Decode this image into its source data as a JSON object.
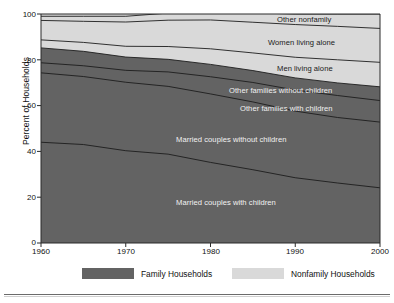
{
  "chart_data": {
    "type": "area",
    "title": "",
    "subtitle": "",
    "xlabel": "",
    "ylabel": "Percent of Households",
    "xlim": [
      1960,
      2000
    ],
    "ylim": [
      0,
      100
    ],
    "grid": false,
    "stacked": true,
    "x": [
      1960,
      1965,
      1970,
      1975,
      1980,
      1985,
      1990,
      1995,
      2000
    ],
    "xticks": [
      "1960",
      "1970",
      "1980",
      "1990",
      "2000"
    ],
    "yticks": [
      "0",
      "20",
      "40",
      "60",
      "80",
      "100"
    ],
    "legend_position": "bottom",
    "series": [
      {
        "name": "Married couples with children",
        "group": "Family Households",
        "color": "#636363",
        "values": [
          44.0,
          43.0,
          40.3,
          38.8,
          35.2,
          32.0,
          28.5,
          26.2,
          24.1
        ]
      },
      {
        "name": "Married couples without children",
        "group": "Family Households",
        "color": "#636363",
        "values": [
          30.3,
          29.7,
          29.9,
          29.6,
          29.9,
          29.6,
          29.1,
          28.6,
          28.7
        ]
      },
      {
        "name": "Other families with children",
        "group": "Family Households",
        "color": "#636363",
        "values": [
          4.4,
          4.7,
          5.2,
          6.3,
          7.5,
          8.5,
          9.2,
          9.6,
          9.4
        ]
      },
      {
        "name": "Other families without children",
        "group": "Family Households",
        "color": "#636363",
        "values": [
          6.5,
          6.3,
          5.8,
          5.5,
          5.4,
          5.2,
          5.3,
          5.5,
          6.0
        ]
      },
      {
        "name": "Men living alone",
        "group": "Nonfamily Households",
        "color": "#d9d9d9",
        "values": [
          3.5,
          3.9,
          4.7,
          5.6,
          6.8,
          7.7,
          9.0,
          10.1,
          10.7
        ]
      },
      {
        "name": "Women living alone",
        "group": "Nonfamily Households",
        "color": "#d9d9d9",
        "values": [
          8.5,
          9.2,
          10.6,
          11.5,
          12.6,
          13.4,
          14.3,
          14.6,
          14.8
        ]
      },
      {
        "name": "Other nonfamily",
        "group": "Nonfamily Households",
        "color": "#d9d9d9",
        "values": [
          1.8,
          2.2,
          2.5,
          3.1,
          3.6,
          4.1,
          4.6,
          5.4,
          6.3
        ]
      }
    ]
  },
  "axes": {
    "ylabel": "Percent of Households",
    "yticks": [
      "100",
      "80",
      "60",
      "40",
      "20",
      "0"
    ],
    "xticks": [
      "1960",
      "1970",
      "1980",
      "1990",
      "2000"
    ]
  },
  "band_labels": [
    {
      "text": "Other nonfamily",
      "tone": "dark-on-light"
    },
    {
      "text": "Women living alone",
      "tone": "dark-on-light"
    },
    {
      "text": "Men living alone",
      "tone": "dark-on-light"
    },
    {
      "text": "Other families without children",
      "tone": "light-on-dark"
    },
    {
      "text": "Other families with children",
      "tone": "light-on-dark"
    },
    {
      "text": "Married couples without children",
      "tone": "light-on-dark"
    },
    {
      "text": "Married couples with children",
      "tone": "light-on-dark"
    }
  ],
  "legend": {
    "items": [
      {
        "label": "Family Households",
        "color": "#636363"
      },
      {
        "label": "Nonfamily Households",
        "color": "#d9d9d9"
      }
    ]
  }
}
